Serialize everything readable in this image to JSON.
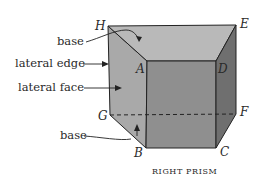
{
  "figure": {
    "caption": "RIGHT PRISM",
    "vertices": {
      "H": "H",
      "E": "E",
      "A": "A",
      "D": "D",
      "G": "G",
      "F": "F",
      "B": "B",
      "C": "C"
    },
    "part_labels": {
      "base_top": "base",
      "lateral_edge": "lateral edge",
      "lateral_face": "lateral face",
      "base_bottom": "base"
    },
    "colors": {
      "top_face": "#b9b9b9",
      "left_face": "#a9a9a9",
      "front_face": "#8f8f8f",
      "right_face": "#6f6f6f",
      "edge": "#222222",
      "background": "#ffffff"
    }
  }
}
